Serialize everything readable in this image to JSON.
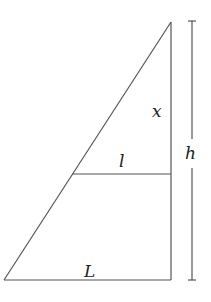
{
  "diagram": {
    "title": "",
    "type": "similar-triangles",
    "colors": {
      "stroke": "#555555",
      "text": "#222222",
      "background": "#ffffff"
    },
    "labels": {
      "x": "x",
      "l": "l",
      "L": "L",
      "h": "h"
    },
    "geometry": {
      "apex": [
        171,
        22
      ],
      "bottom_left": [
        4,
        280
      ],
      "bottom_right": [
        171,
        280
      ],
      "inner_line": {
        "from": [
          72,
          174
        ],
        "to": [
          171,
          174
        ]
      },
      "height_dimension": {
        "x": 192,
        "top": 20,
        "bottom": 280
      }
    }
  }
}
